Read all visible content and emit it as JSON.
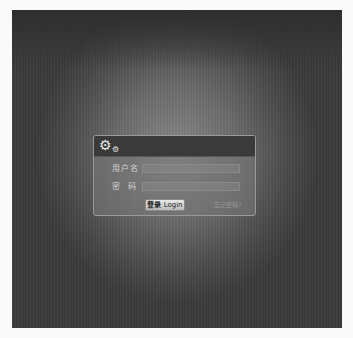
{
  "background": {
    "page_color": "#fafafa",
    "stage_color": "#555555"
  },
  "dialog": {
    "header_icons": [
      "gear-icon",
      "small-gear-icon"
    ],
    "username": {
      "label": "用户名",
      "value": "",
      "placeholder": ""
    },
    "password": {
      "label": "密  码",
      "value": "",
      "placeholder": ""
    },
    "login_button": {
      "label_cn": "登录",
      "label_en": "Login"
    },
    "forgot_link": "忘记密码?"
  }
}
